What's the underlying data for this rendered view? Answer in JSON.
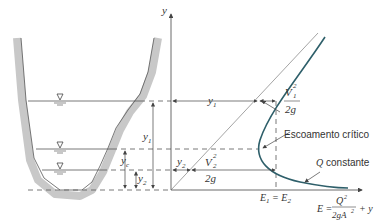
{
  "figure": {
    "axes": {
      "y_axis_label": "y",
      "x_axis_label_lhs": "E =",
      "x_axis_label_num": "Q",
      "x_axis_label_num_exp": "2",
      "x_axis_label_den": "2gA",
      "x_axis_label_den_exp": "2",
      "x_axis_label_rhs": "+ y"
    },
    "labels": {
      "y1_channel": "y",
      "y1_sub": "1",
      "yc": "y",
      "yc_sub": "c",
      "y2_channel": "y",
      "y2_sub": "2",
      "y1_diagram": "y",
      "y1_diagram_sub": "1",
      "y2_diagram": "y",
      "y2_diagram_sub": "2",
      "v1_num": "V",
      "v1_sub": "1",
      "v1_exp": "2",
      "v1_den": "2g",
      "v2_num": "V",
      "v2_sub": "2",
      "v2_exp": "2",
      "v2_den": "2g",
      "critical_flow": "Escoamento crítico",
      "q_constant_var": "Q",
      "q_constant_text": " constante",
      "e1_eq_e2_a": "E",
      "e1_sub": "1",
      "e1_eq": " = E",
      "e2_sub": "2"
    },
    "water_surface_symbol": "▽",
    "colors": {
      "curve": "#2e5f6a",
      "channel_wall": "#c8c8c8",
      "lines": "#444444"
    }
  }
}
